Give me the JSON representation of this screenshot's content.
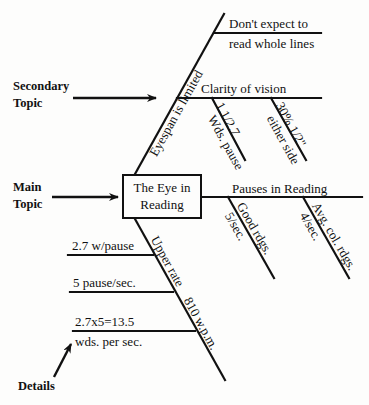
{
  "diagram": {
    "type": "fishbone",
    "main_box": {
      "line1": "The Eye in",
      "line2": "Reading"
    },
    "legend": {
      "main_topic": {
        "line1": "Main",
        "line2": "Topic"
      },
      "secondary_topic": {
        "line1": "Secondary",
        "line2": "Topic"
      },
      "details": "Details"
    },
    "upper_branch": {
      "label": "Eyespan is limited",
      "sub1": {
        "line1": "Don't expect to",
        "line2": "read whole lines"
      },
      "sub2": {
        "label": "Clarity of vision",
        "detail1": {
          "line1": "1.1/2.7",
          "line2": "Wds. pause"
        },
        "detail2": {
          "line1": "30% 1/2\"",
          "line2": "either side"
        }
      }
    },
    "right_branch": {
      "label": "Pauses in Reading",
      "detail1": {
        "line1": "Good rdgs.",
        "line2": "5/sec."
      },
      "detail2": {
        "line1": "Avg. col. rdgs.",
        "line2": "4/sec."
      }
    },
    "lower_branch": {
      "label1": "Upper rate",
      "label2": "810 w.p.m.",
      "detail1": "2.7 w/pause",
      "detail2": "5 pause/sec.",
      "detail3": {
        "line1": "2.7x5=13.5",
        "line2": "wds. per sec."
      }
    }
  }
}
